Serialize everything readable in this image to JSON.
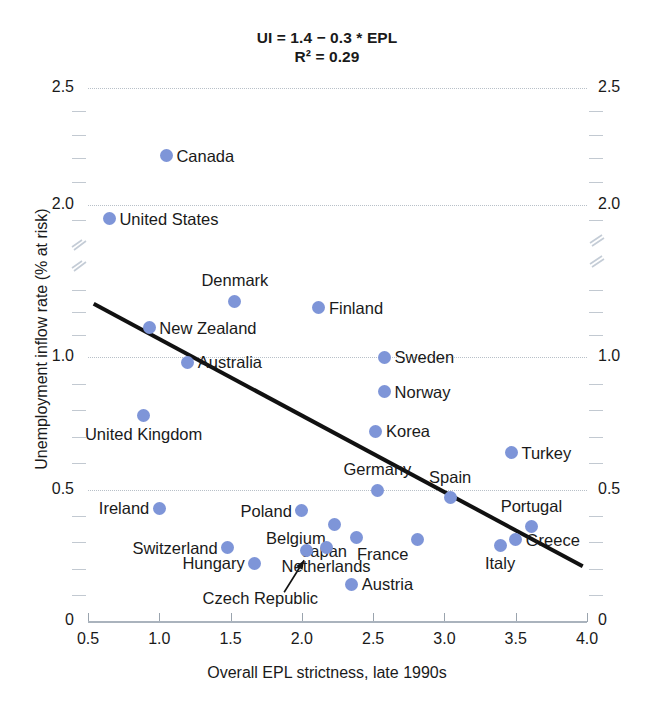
{
  "chart_data": {
    "type": "scatter",
    "title": "UI = 1.4 − 0.3 * EPL",
    "subtitle": "R² = 0.29",
    "xlabel": "Overall EPL strictness, late 1990s",
    "ylabel": "Unemployment inflow rate (% at risk)",
    "xlim": [
      0.5,
      4.0
    ],
    "ylim": [
      0,
      2.5
    ],
    "xticks": [
      "0.5",
      "1.0",
      "1.5",
      "2.0",
      "2.5",
      "3.0",
      "3.5",
      "4.0"
    ],
    "yticks": [
      "0",
      "0.5",
      "1.0",
      "2.0",
      "2.5"
    ],
    "grid": "horizontal-dotted",
    "legend": "none",
    "axis_break": {
      "present": true,
      "axis": "y",
      "between": [
        1.3,
        1.85
      ]
    },
    "point_color": "#7e95d8",
    "trendline": {
      "label": "UI = 1.4 − 0.3 * EPL",
      "intercept": 1.4,
      "slope": -0.3,
      "r_squared": 0.29,
      "color": "#111111",
      "x_start": 0.54,
      "x_end": 3.97
    },
    "points": [
      {
        "name": "Canada",
        "x": 1.05,
        "y": 2.21,
        "label_pos": "right"
      },
      {
        "name": "United States",
        "x": 0.65,
        "y": 1.91,
        "label_pos": "right"
      },
      {
        "name": "Denmark",
        "x": 1.53,
        "y": 1.25,
        "label_pos": "top"
      },
      {
        "name": "Finland",
        "x": 2.12,
        "y": 1.22,
        "label_pos": "right"
      },
      {
        "name": "New Zealand",
        "x": 0.93,
        "y": 1.13,
        "label_pos": "right"
      },
      {
        "name": "Australia",
        "x": 1.2,
        "y": 0.98,
        "label_pos": "right"
      },
      {
        "name": "Sweden",
        "x": 2.58,
        "y": 1.0,
        "label_pos": "right"
      },
      {
        "name": "Norway",
        "x": 2.58,
        "y": 0.87,
        "label_pos": "right"
      },
      {
        "name": "United Kingdom",
        "x": 0.89,
        "y": 0.78,
        "label_pos": "bottom"
      },
      {
        "name": "Korea",
        "x": 2.52,
        "y": 0.72,
        "label_pos": "right"
      },
      {
        "name": "Turkey",
        "x": 3.47,
        "y": 0.64,
        "label_pos": "right"
      },
      {
        "name": "Germany",
        "x": 2.53,
        "y": 0.5,
        "label_pos": "top"
      },
      {
        "name": "Spain",
        "x": 3.04,
        "y": 0.47,
        "label_pos": "top"
      },
      {
        "name": "Ireland",
        "x": 1.0,
        "y": 0.43,
        "label_pos": "left"
      },
      {
        "name": "Poland",
        "x": 2.0,
        "y": 0.42,
        "label_pos": "left"
      },
      {
        "name": "Portugal",
        "x": 3.61,
        "y": 0.36,
        "label_pos": "top"
      },
      {
        "name": "Belgium",
        "x": 2.23,
        "y": 0.37,
        "label_pos": "bottomleft"
      },
      {
        "name": "Japan",
        "x": 2.38,
        "y": 0.32,
        "label_pos": "bottomleft"
      },
      {
        "name": "France",
        "x": 2.81,
        "y": 0.31,
        "label_pos": "bottomleft"
      },
      {
        "name": "Italy",
        "x": 3.39,
        "y": 0.29,
        "label_pos": "bottom"
      },
      {
        "name": "Greece",
        "x": 3.5,
        "y": 0.31,
        "label_pos": "right"
      },
      {
        "name": "Switzerland",
        "x": 1.48,
        "y": 0.28,
        "label_pos": "left"
      },
      {
        "name": "Hungary",
        "x": 1.67,
        "y": 0.22,
        "label_pos": "left"
      },
      {
        "name": "Czech Republic",
        "x": 2.03,
        "y": 0.27,
        "label_pos": "arrow-bottomleft"
      },
      {
        "name": "Netherlands",
        "x": 2.17,
        "y": 0.28,
        "label_pos": "bottom"
      },
      {
        "name": "Austria",
        "x": 2.35,
        "y": 0.14,
        "label_pos": "right"
      }
    ]
  }
}
